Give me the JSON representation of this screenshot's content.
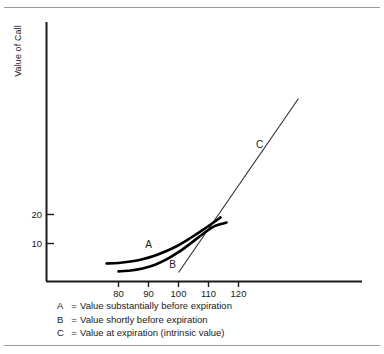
{
  "figure": {
    "y_axis_title": "Value of Call",
    "legend": [
      {
        "key": "A",
        "eq": "=",
        "desc": "Value substantially before expiration"
      },
      {
        "key": "B",
        "eq": "=",
        "desc": "Value shortly before expiration"
      },
      {
        "key": "C",
        "eq": "=",
        "desc": "Value at expiration (intrinsic value)"
      }
    ],
    "curve_labels": {
      "a": "A",
      "b": "B",
      "c": "C"
    }
  },
  "chart_data": {
    "type": "line",
    "title": "",
    "xlabel": "",
    "ylabel": "Value of Call",
    "xlim": [
      70,
      141
    ],
    "ylim": [
      0,
      90
    ],
    "grid": false,
    "legend_position": "below-plot",
    "xticks": [
      80,
      90,
      100,
      110,
      120
    ],
    "yticks": [
      10,
      20
    ],
    "xtick_labels": [
      "80",
      "90",
      "100",
      "110",
      "120"
    ],
    "ytick_labels": [
      "10",
      "20"
    ],
    "series": [
      {
        "name": "A",
        "label": "A",
        "description": "Value substantially before expiration",
        "style": "thick-curve",
        "x": [
          76,
          80,
          84,
          88,
          92,
          96,
          100,
          104,
          108,
          112,
          114
        ],
        "values": [
          3.1,
          3.3,
          3.8,
          4.6,
          5.8,
          7.4,
          9.4,
          11.9,
          14.6,
          17.5,
          19.0
        ]
      },
      {
        "name": "B",
        "label": "B",
        "description": "Value shortly before expiration",
        "style": "thick-curve",
        "x": [
          80,
          84,
          88,
          92,
          96,
          100,
          104,
          108,
          112,
          116
        ],
        "values": [
          0.4,
          0.7,
          1.4,
          2.6,
          4.5,
          7.0,
          10.0,
          13.2,
          16.0,
          17.2
        ]
      },
      {
        "name": "C",
        "label": "C",
        "description": "Value at expiration (intrinsic value)",
        "style": "thin-line",
        "x": [
          100,
          140
        ],
        "values": [
          0,
          60
        ]
      }
    ],
    "annotations": [
      {
        "text": "A",
        "x": 90,
        "y": 8.5
      },
      {
        "text": "B",
        "x": 98,
        "y": 1.6
      },
      {
        "text": "C",
        "x": 127,
        "y": 43
      }
    ]
  }
}
